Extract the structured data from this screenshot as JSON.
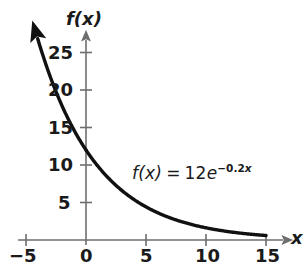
{
  "chart_data": {
    "type": "line",
    "title": "",
    "subtitle": "",
    "xlabel": "x",
    "ylabel": "f(x)",
    "equation_text": "f(x) = 12e^-0.2x",
    "annotation": {
      "fn_name": "f(x)",
      "equals": "=",
      "coefficient": "12",
      "base": "e",
      "exponent_sign": "−",
      "exponent_coeff": "0.2",
      "exponent_var": "x"
    },
    "formula": {
      "a": 12,
      "k": -0.2,
      "expression": "12*exp(-0.2*x)"
    },
    "xlim": [
      -5,
      15
    ],
    "ylim": [
      0,
      27
    ],
    "grid": false,
    "legend": "none",
    "xticks": [
      -5,
      0,
      5,
      10,
      15
    ],
    "xtick_labels": [
      "−5",
      "0",
      "5",
      "10",
      "15"
    ],
    "yticks": [
      5,
      10,
      15,
      20,
      25
    ],
    "ytick_labels": [
      "5",
      "10",
      "15",
      "20",
      "25"
    ],
    "series": [
      {
        "name": "f(x) = 12e^-0.2x",
        "color": "#111111",
        "x": [
          -5.7,
          -5,
          -4,
          -3,
          -2,
          -1,
          0,
          1,
          2,
          3,
          4,
          5,
          6,
          7,
          8,
          9,
          10,
          11,
          12,
          13,
          14,
          15
        ],
        "y": [
          37.4,
          32.6,
          26.7,
          21.9,
          17.9,
          14.7,
          12.0,
          9.8,
          8.0,
          6.6,
          5.4,
          4.4,
          3.6,
          3.0,
          2.4,
          2.0,
          1.6,
          1.3,
          1.1,
          0.9,
          0.7,
          0.6
        ]
      }
    ],
    "axis_color": "#6e6e6e",
    "curve_color": "#111111",
    "background": "#ffffff"
  },
  "axes": {
    "x_name": "x",
    "y_name": "f(x)"
  },
  "x_tick_labels": {
    "t0": "−5",
    "t1": "0",
    "t2": "5",
    "t3": "10",
    "t4": "15"
  },
  "y_tick_labels": {
    "t0": "5",
    "t1": "10",
    "t2": "15",
    "t3": "20",
    "t4": "25"
  }
}
